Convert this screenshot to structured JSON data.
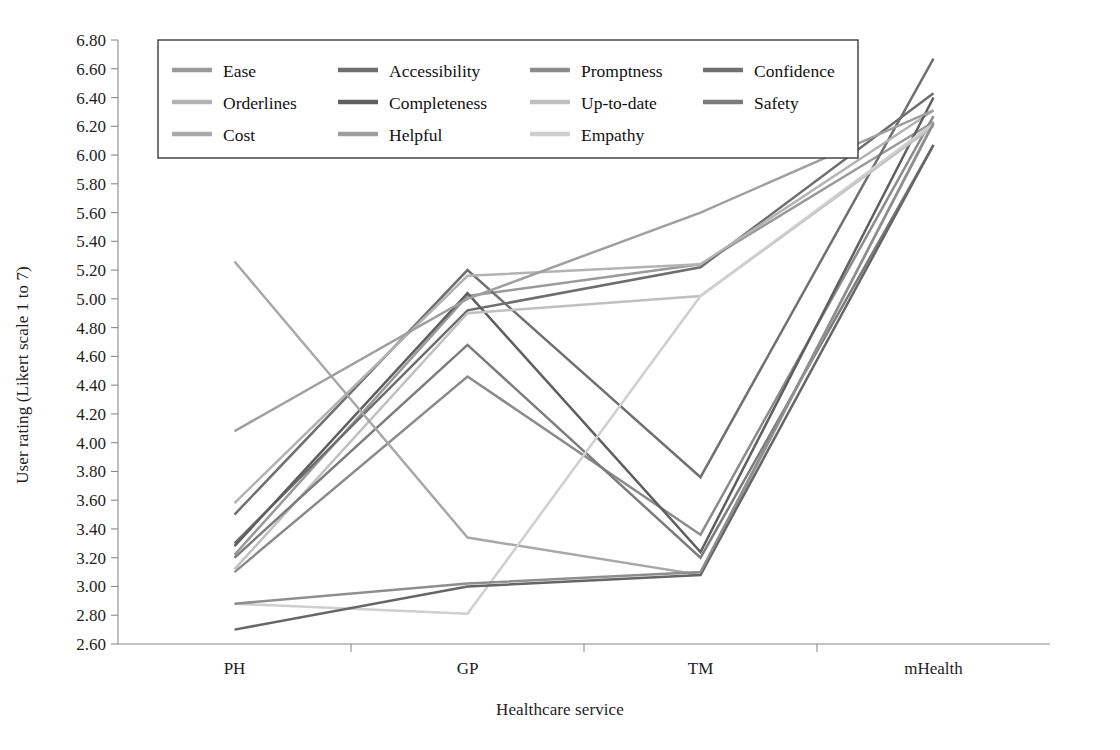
{
  "chart_data": {
    "type": "line",
    "title": "",
    "xlabel": "Healthcare service",
    "ylabel": "User rating (Likert scale 1 to 7)",
    "categories": [
      "PH",
      "GP",
      "TM",
      "mHealth"
    ],
    "ylim": [
      2.6,
      6.8
    ],
    "ytick_step": 0.2,
    "ytick_labels": [
      "6.80",
      "6.60",
      "6.40",
      "6.20",
      "6.00",
      "5.80",
      "5.60",
      "5.40",
      "5.20",
      "5.00",
      "4.80",
      "4.60",
      "4.40",
      "4.20",
      "4.00",
      "3.80",
      "3.60",
      "3.40",
      "3.20",
      "3.00",
      "2.80",
      "2.60"
    ],
    "grid": false,
    "legend_position": "top-inside",
    "legend_columns": 4,
    "series": [
      {
        "name": "Ease",
        "values": [
          3.22,
          5.02,
          5.24,
          6.23
        ],
        "color": "#9a9a9a"
      },
      {
        "name": "Accessibility",
        "values": [
          3.3,
          4.92,
          5.22,
          6.43
        ],
        "color": "#6e6e6e"
      },
      {
        "name": "Promptness",
        "values": [
          3.1,
          4.46,
          3.36,
          6.27
        ],
        "color": "#8b8b8b"
      },
      {
        "name": "Confidence",
        "values": [
          3.5,
          5.2,
          3.76,
          6.67
        ],
        "color": "#707070"
      },
      {
        "name": "Orderlines",
        "values": [
          3.58,
          5.16,
          5.24,
          6.31
        ],
        "color": "#b3b3b3"
      },
      {
        "name": "Completeness",
        "values": [
          3.28,
          5.04,
          3.24,
          6.4
        ],
        "color": "#5f5f5f"
      },
      {
        "name": "Up-to-date",
        "values": [
          3.12,
          4.9,
          5.02,
          6.2
        ],
        "color": "#c0c0c0"
      },
      {
        "name": "Safety",
        "values": [
          3.2,
          4.68,
          3.2,
          6.07
        ],
        "color": "#7c7c7c"
      },
      {
        "name": "Cost",
        "values": [
          5.26,
          3.34,
          3.08,
          6.23
        ],
        "color": "#a8a8a8"
      },
      {
        "name": "Helpful",
        "values": [
          4.08,
          5.0,
          5.6,
          6.31
        ],
        "color": "#9f9f9f"
      },
      {
        "name": "Empathy",
        "values": [
          2.88,
          2.81,
          5.02,
          6.22
        ],
        "color": "#cfcfcf"
      }
    ],
    "flat_series_note": [
      {
        "name": "Ease-low",
        "values": [
          2.7,
          3.0,
          3.08,
          6.07
        ],
        "color": "#666666"
      },
      {
        "name": "Cost-low",
        "values": [
          2.88,
          3.02,
          3.1,
          6.22
        ],
        "color": "#8e8e8e"
      }
    ]
  },
  "legend": {
    "items": [
      {
        "label": "Ease"
      },
      {
        "label": "Accessibility"
      },
      {
        "label": "Promptness"
      },
      {
        "label": "Confidence"
      },
      {
        "label": "Orderlines"
      },
      {
        "label": "Completeness"
      },
      {
        "label": "Up-to-date"
      },
      {
        "label": "Safety"
      },
      {
        "label": "Cost"
      },
      {
        "label": "Helpful"
      },
      {
        "label": "Empathy"
      }
    ]
  }
}
